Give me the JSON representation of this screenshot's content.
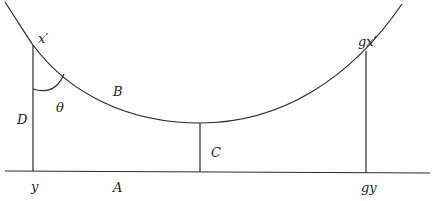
{
  "diagram": {
    "labels": {
      "x_prime": "x′",
      "gx_prime": "gx′",
      "B": "B",
      "theta": "θ",
      "D": "D",
      "C": "C",
      "y": "y",
      "A": "A",
      "gy": "gy"
    },
    "colors": {
      "stroke": "#2a2a2a",
      "background": "#ffffff"
    }
  }
}
